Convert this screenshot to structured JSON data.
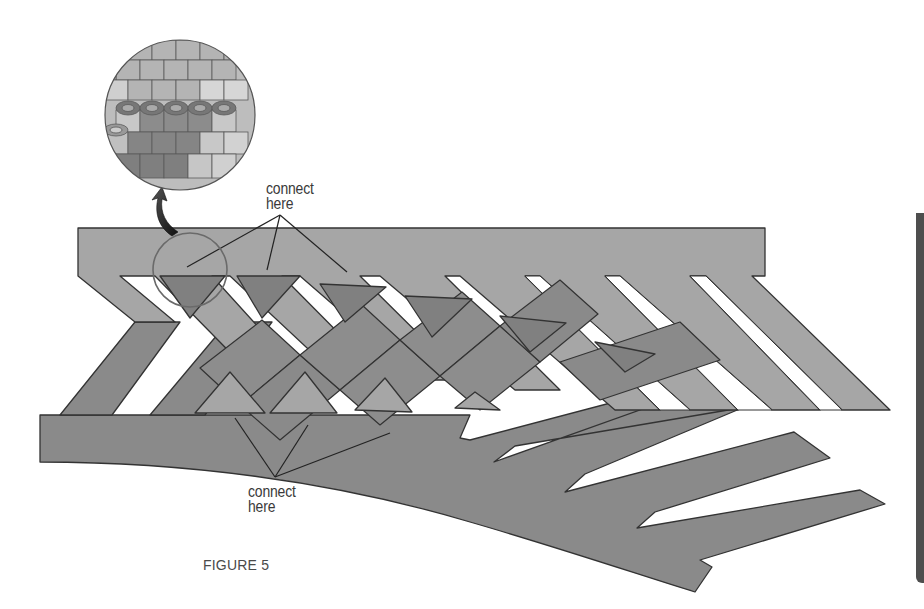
{
  "figure": {
    "caption": "FIGURE 5",
    "labels": {
      "top_connect": [
        "connect",
        "here"
      ],
      "bottom_connect": [
        "connect",
        "here"
      ]
    }
  },
  "colors": {
    "light_panel": "#a6a6a6",
    "dark_panel": "#8a8a8a",
    "triangle_dark": "#7f7f7f",
    "outline": "#333333",
    "background": "#ffffff",
    "circle_outline": "#6a6a6a",
    "arrow": "#2a2a2a",
    "edge_bar": "#4e4e4e"
  },
  "elements": {
    "detail_magnifier": "bead-detail-circle",
    "callout_circle": "connection-highlight-circle",
    "top_panel": "light-woven-panel",
    "bottom_panel": "dark-woven-panel"
  }
}
